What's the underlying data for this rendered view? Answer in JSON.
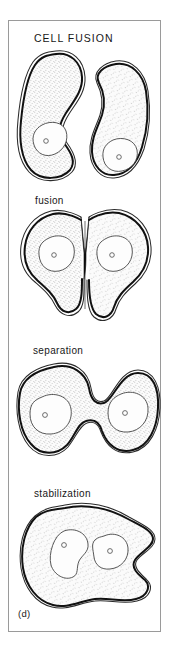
{
  "figure": {
    "plate_tag": "(d)",
    "frame_color": "#9a9a9a",
    "background_color": "#ffffff",
    "ink_color": "#111111"
  },
  "panels": [
    {
      "id": "cell-fusion",
      "label": "CELL FUSION",
      "label_case": "uppercase",
      "stage_index": 1,
      "cell_count": 2,
      "nuclei_total": 2,
      "description": "two separate bean-shaped cells, each with a single nucleus and nucleolus"
    },
    {
      "id": "fusion",
      "label": "fusion",
      "label_case": "lowercase",
      "stage_index": 2,
      "cell_count": 2,
      "nuclei_total": 2,
      "description": "two cells joined at a narrow dark membrane bridge at the centre"
    },
    {
      "id": "separation",
      "label": "separation",
      "label_case": "lowercase",
      "stage_index": 3,
      "cell_count": 1,
      "nuclei_total": 2,
      "description": "single dumbbell shaped binucleate cell with a deep central waist"
    },
    {
      "id": "stabilization",
      "label": "stabilization",
      "label_case": "lowercase",
      "stage_index": 4,
      "cell_count": 1,
      "nuclei_total": 2,
      "description": "single rounded binucleate cell with two kidney shaped nuclei"
    }
  ]
}
